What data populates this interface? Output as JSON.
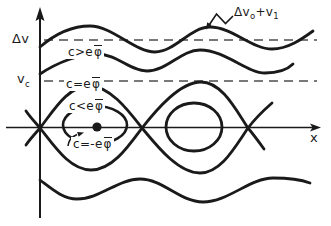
{
  "colors": {
    "ink": "#1a1a1a",
    "dash": "#4d4d4d",
    "background": "#ffffff"
  },
  "axes": {
    "x_label": "x"
  },
  "levels": {
    "delta_v": "Δv",
    "v_c_base": "v",
    "v_c_sub": "c"
  },
  "annotation": {
    "base1": "Δv",
    "sub1": "o",
    "base2": "+v",
    "sub2": "1"
  },
  "curve_labels": {
    "untrapped": {
      "pre": "c>e",
      "phi": "φ"
    },
    "separatrix": {
      "pre": "c=e",
      "phi": "φ"
    },
    "trapped": {
      "pre": "c<e",
      "phi": "φ"
    },
    "o_point": {
      "pre": "c=-e",
      "phi": "φ"
    }
  }
}
